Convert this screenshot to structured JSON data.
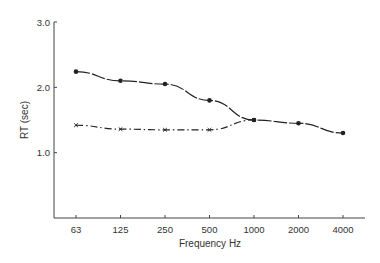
{
  "chart_data": {
    "type": "line",
    "title": "",
    "xlabel": "Frequency  Hz",
    "ylabel": "RT (sec)",
    "categories": [
      "63",
      "125",
      "250",
      "500",
      "1000",
      "2000",
      "4000"
    ],
    "y_ticks": [
      "1.0",
      "2.0",
      "3.0"
    ],
    "ylim": [
      0,
      3.0
    ],
    "grid": false,
    "legend": null,
    "series": [
      {
        "name": "Series A (solid, dot markers)",
        "style": "solid",
        "marker": "dot",
        "values": [
          2.24,
          2.1,
          2.05,
          1.8,
          1.5,
          1.45,
          1.3
        ]
      },
      {
        "name": "Series B (dash-dot, x markers)",
        "style": "dashdot",
        "marker": "x",
        "values": [
          1.42,
          1.36,
          1.35,
          1.35,
          1.5,
          null,
          null
        ]
      }
    ]
  },
  "colors": {
    "line": "#222222",
    "axis": "#444444",
    "text": "#333333"
  }
}
